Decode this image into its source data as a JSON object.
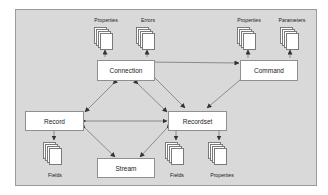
{
  "diagram": {
    "nodes": {
      "connection": {
        "label": "Connection"
      },
      "command": {
        "label": "Command"
      },
      "record": {
        "label": "Record"
      },
      "recordset": {
        "label": "Recordset"
      },
      "stream": {
        "label": "Stream"
      }
    },
    "collections": [
      {
        "id": "connection-properties",
        "label": "Properties",
        "parent": "Connection"
      },
      {
        "id": "connection-errors",
        "label": "Errors",
        "parent": "Connection"
      },
      {
        "id": "command-properties",
        "label": "Properties",
        "parent": "Command"
      },
      {
        "id": "command-parameters",
        "label": "Parameters",
        "parent": "Command"
      },
      {
        "id": "record-fields",
        "label": "Fields",
        "parent": "Record"
      },
      {
        "id": "recordset-fields",
        "label": "Fields",
        "parent": "Recordset"
      },
      {
        "id": "recordset-properties",
        "label": "Properties",
        "parent": "Recordset"
      }
    ],
    "edges": [
      {
        "from": "Connection",
        "to": "Command",
        "type": "bidirectional"
      },
      {
        "from": "Connection",
        "to": "Record",
        "type": "bidirectional"
      },
      {
        "from": "Connection",
        "to": "Recordset",
        "type": "bidirectional"
      },
      {
        "from": "Command",
        "to": "Recordset",
        "type": "bidirectional"
      },
      {
        "from": "Record",
        "to": "Recordset",
        "type": "bidirectional"
      },
      {
        "from": "Record",
        "to": "Stream",
        "type": "bidirectional"
      },
      {
        "from": "Recordset",
        "to": "Stream",
        "type": "bidirectional"
      },
      {
        "from": "Connection",
        "to": "Properties",
        "type": "contains"
      },
      {
        "from": "Connection",
        "to": "Errors",
        "type": "contains"
      },
      {
        "from": "Command",
        "to": "Properties",
        "type": "contains"
      },
      {
        "from": "Command",
        "to": "Parameters",
        "type": "contains"
      },
      {
        "from": "Record",
        "to": "Fields",
        "type": "contains"
      },
      {
        "from": "Recordset",
        "to": "Fields",
        "type": "contains"
      },
      {
        "from": "Recordset",
        "to": "Properties",
        "type": "contains"
      }
    ],
    "colors": {
      "panel": "#d9d9d9",
      "box": "#ffffff",
      "line": "#555555"
    }
  }
}
